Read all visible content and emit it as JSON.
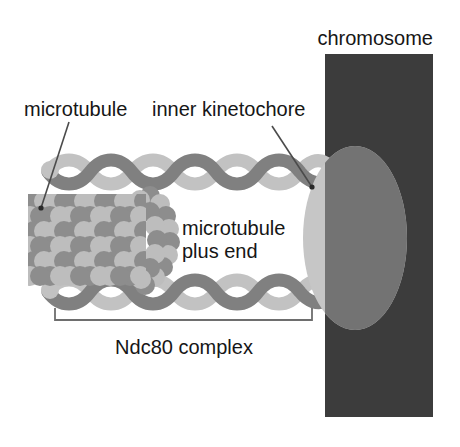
{
  "figure": {
    "width": 460,
    "height": 447
  },
  "labels": {
    "chromosome": "chromosome",
    "microtubule": "microtubule",
    "inner_kinetochore": "inner kinetochore",
    "plus_end_line1": "microtubule",
    "plus_end_line2": "plus end",
    "ndc80": "Ndc80 complex"
  },
  "colors": {
    "background": "#ffffff",
    "text": "#161616",
    "chromosome_bar": "#3c3c3c",
    "kinetochore_ellipse": "#c6c6c6",
    "kinetochore_overlap": "#737373",
    "coil_dark_strand": "#808080",
    "coil_light_strand": "#c2c2c2",
    "tubulin_dark": "#8d8d8d",
    "tubulin_light": "#bdbdbd",
    "leader_line": "#4b4b4b",
    "bracket": "#6e6e6e"
  },
  "structures": {
    "chromosome_bar": {
      "x": 325,
      "y": 54,
      "width": 108,
      "height": 363
    },
    "kinetochore_ellipse": {
      "cx": 355,
      "cy": 238,
      "rx": 52,
      "ry": 92
    },
    "microtubule_lattice": {
      "x": 30,
      "y": 196,
      "width": 142,
      "height": 90
    },
    "upper_coil": {
      "x1": 48,
      "x2": 318,
      "y": 172
    },
    "lower_coil": {
      "x1": 48,
      "x2": 318,
      "y": 292
    },
    "ndc80_bracket": {
      "x1": 55,
      "x2": 312,
      "y": 320,
      "tick_height": 11
    }
  },
  "leaders": {
    "microtubule": {
      "x1": 69,
      "y1": 122,
      "x2": 41,
      "y2": 208
    },
    "inner_kinetochore": {
      "x1": 272,
      "y1": 126,
      "x2": 312,
      "y2": 187
    }
  }
}
